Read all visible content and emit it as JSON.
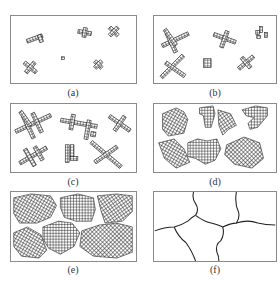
{
  "figure": {
    "panels": [
      {
        "id": "a",
        "label": "(a)",
        "stage": "initial small nuclei (crosses and dots)"
      },
      {
        "id": "b",
        "label": "(b)",
        "stage": "nuclei grow into dendritic cross arms"
      },
      {
        "id": "c",
        "label": "(c)",
        "stage": "dendrites branch further"
      },
      {
        "id": "d",
        "label": "(d)",
        "stage": "dendrites fill in to form compact grains"
      },
      {
        "id": "e",
        "label": "(e)",
        "stage": "grains impinge, nearly filling domain"
      },
      {
        "id": "f",
        "label": "(f)",
        "stage": "final grain boundary network"
      }
    ]
  },
  "colors": {
    "border": "#8a8a8a",
    "ink": "#222222",
    "background": "#ffffff"
  }
}
